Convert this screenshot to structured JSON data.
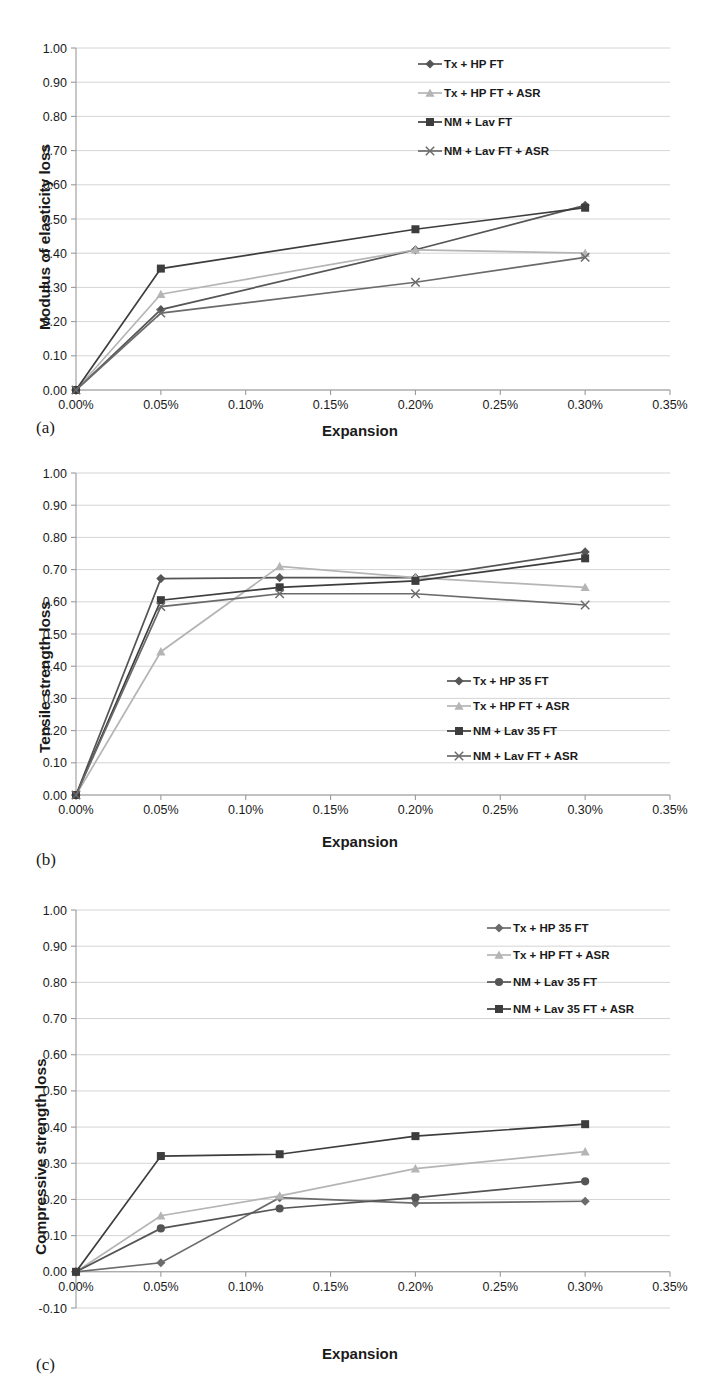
{
  "figure": {
    "panels": [
      "(a)",
      "(b)",
      "(c)"
    ],
    "xlabel": "Expansion",
    "x_tick_labels": [
      "0.00%",
      "0.05%",
      "0.10%",
      "0.15%",
      "0.20%",
      "0.25%",
      "0.30%",
      "0.35%"
    ],
    "y_tick_labels_ab": [
      "1.00",
      "0.90",
      "0.80",
      "0.70",
      "0.60",
      "0.50",
      "0.40",
      "0.30",
      "0.20",
      "0.10",
      "0.00"
    ],
    "y_tick_labels_c": [
      "1.00",
      "0.90",
      "0.80",
      "0.70",
      "0.60",
      "0.50",
      "0.40",
      "0.30",
      "0.20",
      "0.10",
      "0.00",
      "-0.10"
    ]
  },
  "colors": {
    "series_dark": "#555555",
    "series_light": "#b5b5b5",
    "series_darker": "#3d3d3d",
    "series_mid": "#6b6b6b",
    "grid": "#c9c9c9",
    "axis": "#9a9a9a",
    "text": "#1a1a1a"
  },
  "chart_data": [
    {
      "type": "line",
      "panel": "(a)",
      "title": "",
      "xlabel": "Expansion",
      "ylabel": "Modulus of elasticity loss",
      "xlim": [
        0.0,
        0.35
      ],
      "ylim": [
        0.0,
        1.0
      ],
      "grid": true,
      "legend_position": "top-right",
      "x": [
        0.0,
        0.05,
        0.2,
        0.3
      ],
      "series": [
        {
          "name": "Tx + HP FT",
          "marker": "diamond",
          "color": "#555555",
          "values": [
            0.0,
            0.235,
            0.41,
            0.54
          ]
        },
        {
          "name": "Tx + HP FT + ASR",
          "marker": "triangle",
          "color": "#b5b5b5",
          "values": [
            0.0,
            0.28,
            0.41,
            0.4
          ]
        },
        {
          "name": "NM + Lav FT",
          "marker": "square",
          "color": "#3d3d3d",
          "values": [
            0.0,
            0.355,
            0.47,
            0.533
          ]
        },
        {
          "name": "NM + Lav FT + ASR",
          "marker": "cross",
          "color": "#6b6b6b",
          "values": [
            0.0,
            0.225,
            0.315,
            0.388
          ]
        }
      ]
    },
    {
      "type": "line",
      "panel": "(b)",
      "title": "",
      "xlabel": "Expansion",
      "ylabel": "Tensile strength loss",
      "xlim": [
        0.0,
        0.35
      ],
      "ylim": [
        0.0,
        1.0
      ],
      "grid": true,
      "legend_position": "center-right",
      "x": [
        0.0,
        0.05,
        0.12,
        0.2,
        0.3
      ],
      "series": [
        {
          "name": "Tx + HP 35 FT",
          "marker": "diamond",
          "color": "#555555",
          "values": [
            0.0,
            0.672,
            0.675,
            0.675,
            0.755
          ]
        },
        {
          "name": "Tx + HP FT + ASR",
          "marker": "triangle",
          "color": "#b5b5b5",
          "values": [
            0.0,
            0.445,
            0.71,
            0.675,
            0.645
          ]
        },
        {
          "name": "NM + Lav 35 FT",
          "marker": "square",
          "color": "#3d3d3d",
          "values": [
            0.0,
            0.605,
            0.645,
            0.665,
            0.735
          ]
        },
        {
          "name": "NM + Lav FT + ASR",
          "marker": "cross",
          "color": "#6b6b6b",
          "values": [
            0.0,
            0.585,
            0.625,
            0.625,
            0.59
          ]
        }
      ]
    },
    {
      "type": "line",
      "panel": "(c)",
      "title": "",
      "xlabel": "Expansion",
      "ylabel": "Compressive strength loss",
      "xlim": [
        0.0,
        0.35
      ],
      "ylim": [
        -0.1,
        1.0
      ],
      "grid": true,
      "legend_position": "top-right",
      "x": [
        0.0,
        0.05,
        0.12,
        0.2,
        0.3
      ],
      "series": [
        {
          "name": "Tx + HP 35 FT",
          "marker": "diamond",
          "color": "#6b6b6b",
          "values": [
            0.0,
            0.025,
            0.205,
            0.19,
            0.195
          ]
        },
        {
          "name": "Tx + HP FT + ASR",
          "marker": "triangle",
          "color": "#b5b5b5",
          "values": [
            0.0,
            0.155,
            0.21,
            0.285,
            0.332
          ]
        },
        {
          "name": "NM + Lav 35 FT",
          "marker": "circle",
          "color": "#555555",
          "values": [
            0.0,
            0.12,
            0.175,
            0.205,
            0.25
          ]
        },
        {
          "name": "NM + Lav 35 FT + ASR",
          "marker": "square",
          "color": "#3d3d3d",
          "values": [
            0.0,
            0.32,
            0.325,
            0.375,
            0.408
          ]
        }
      ]
    }
  ]
}
